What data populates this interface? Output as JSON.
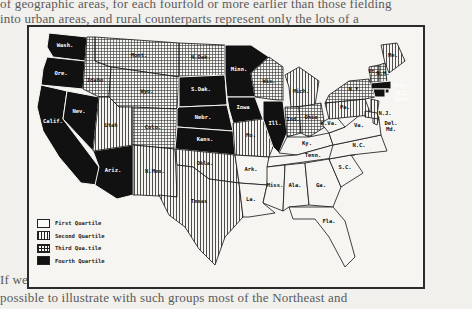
{
  "page_text": {
    "lines_above": [
      "of geographic areas, for each fourfold or more earlier than those fielding",
      "into urban areas, and rural counterparts represent only the lots of a",
      "a unit in the total economy of the larger regions and those. The",
      "course of rural realities within the region ..."
    ],
    "lines_right": [
      "ranged",
      "ent",
      "ssue",
      "as of",
      "Wb"
    ],
    "lines_below": [
      "If we wish to develop a national ... sing a larger scale it is",
      "possible to illustrate with such groups most of the Northeast and",
      "the Southeast in the reproduction of and planning for these regions"
    ]
  },
  "map": {
    "title": "",
    "patterns": {
      "first": "blank",
      "second": "vertical-lines",
      "third": "crosshatch",
      "fourth": "solid-black"
    },
    "colors": {
      "ink": "#111111",
      "paper": "#f6f5f2",
      "page": "#f1f0ec"
    },
    "legend": [
      {
        "key": "first",
        "label": "First Quartile"
      },
      {
        "key": "second",
        "label": "Second Quartile"
      },
      {
        "key": "third",
        "label": "Third Qua.tile"
      },
      {
        "key": "fourth",
        "label": "Fourth Quartile"
      }
    ],
    "states": [
      {
        "abbr": "Wash.",
        "quartile": "fourth"
      },
      {
        "abbr": "Ore.",
        "quartile": "fourth"
      },
      {
        "abbr": "Calif.",
        "quartile": "fourth"
      },
      {
        "abbr": "Nev.",
        "quartile": "fourth"
      },
      {
        "abbr": "Ariz.",
        "quartile": "fourth"
      },
      {
        "abbr": "Idaho",
        "quartile": "third"
      },
      {
        "abbr": "Mont.",
        "quartile": "third"
      },
      {
        "abbr": "Wyo.",
        "quartile": "third"
      },
      {
        "abbr": "Utah",
        "quartile": "second"
      },
      {
        "abbr": "Colo.",
        "quartile": "third"
      },
      {
        "abbr": "N.Mex.",
        "quartile": "second"
      },
      {
        "abbr": "N.Dak.",
        "quartile": "third"
      },
      {
        "abbr": "S.Dak.",
        "quartile": "fourth"
      },
      {
        "abbr": "Nebr.",
        "quartile": "fourth"
      },
      {
        "abbr": "Kans.",
        "quartile": "fourth"
      },
      {
        "abbr": "Okla.",
        "quartile": "second"
      },
      {
        "abbr": "Texas",
        "quartile": "second"
      },
      {
        "abbr": "Minn.",
        "quartile": "fourth"
      },
      {
        "abbr": "Iowa",
        "quartile": "fourth"
      },
      {
        "abbr": "Mo.",
        "quartile": "second"
      },
      {
        "abbr": "Ark.",
        "quartile": "first"
      },
      {
        "abbr": "La.",
        "quartile": "first"
      },
      {
        "abbr": "Wis.",
        "quartile": "third"
      },
      {
        "abbr": "Ill.",
        "quartile": "fourth"
      },
      {
        "abbr": "Mich.",
        "quartile": "second"
      },
      {
        "abbr": "Ind.",
        "quartile": "third"
      },
      {
        "abbr": "Ohio",
        "quartile": "third"
      },
      {
        "abbr": "Ky.",
        "quartile": "first"
      },
      {
        "abbr": "Tenn.",
        "quartile": "first"
      },
      {
        "abbr": "Miss.",
        "quartile": "first"
      },
      {
        "abbr": "Ala.",
        "quartile": "first"
      },
      {
        "abbr": "Ga.",
        "quartile": "first"
      },
      {
        "abbr": "Fla.",
        "quartile": "first"
      },
      {
        "abbr": "S.C.",
        "quartile": "first"
      },
      {
        "abbr": "N.C.",
        "quartile": "first"
      },
      {
        "abbr": "Va.",
        "quartile": "first"
      },
      {
        "abbr": "W.Va.",
        "quartile": "first"
      },
      {
        "abbr": "Pa.",
        "quartile": "second"
      },
      {
        "abbr": "N.Y.",
        "quartile": "third"
      },
      {
        "abbr": "Vt.",
        "quartile": "third"
      },
      {
        "abbr": "N.H.",
        "quartile": "third"
      },
      {
        "abbr": "Me.",
        "quartile": "second"
      },
      {
        "abbr": "Mass.",
        "quartile": "fourth"
      },
      {
        "abbr": "R.I.",
        "quartile": "fourth"
      },
      {
        "abbr": "Conn.",
        "quartile": "fourth"
      },
      {
        "abbr": "N.J.",
        "quartile": "second"
      },
      {
        "abbr": "Del.",
        "quartile": "second"
      },
      {
        "abbr": "Md.",
        "quartile": "second"
      }
    ]
  }
}
